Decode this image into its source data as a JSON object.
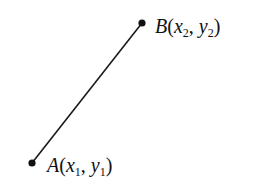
{
  "diagram": {
    "line_color": "#1a1a1a",
    "point_a": {
      "name": "A",
      "x_sym": "x",
      "x_sub": "1",
      "y_sym": "y",
      "y_sub": "1",
      "px": 32,
      "py": 163
    },
    "point_b": {
      "name": "B",
      "x_sym": "x",
      "x_sub": "2",
      "y_sym": "y",
      "y_sub": "2",
      "px": 142,
      "py": 23
    },
    "punct": {
      "open": "(",
      "comma": ", ",
      "close": ")"
    }
  }
}
